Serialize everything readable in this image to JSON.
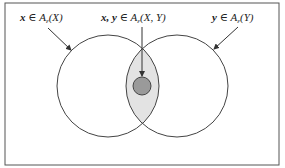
{
  "diagram": {
    "type": "venn",
    "colors": {
      "frame": "#555555",
      "stroke": "#444444",
      "intersection_fill": "#e3e3e3",
      "core_fill": "#9a9a9a",
      "background": "#ffffff"
    },
    "labels": {
      "left": {
        "var": "x",
        "rel": " ∈ ",
        "set": "A",
        "sub": "ε",
        "arg": "(X)"
      },
      "center": {
        "var": "x, y",
        "rel": " ∈ ",
        "set": "A",
        "sub": "ε",
        "arg": "(X, Y)"
      },
      "right": {
        "var": "y",
        "rel": " ∈ ",
        "set": "A",
        "sub": "ε",
        "arg": "(Y)"
      }
    },
    "sets": [
      {
        "name": "A_ε(X)",
        "cx": 108,
        "cy": 86,
        "r": 51
      },
      {
        "name": "A_ε(Y)",
        "cx": 177,
        "cy": 86,
        "r": 51
      }
    ],
    "intersection": {
      "name": "A_ε(X, Y)",
      "core": {
        "cx": 142,
        "cy": 86,
        "r": 9
      }
    }
  }
}
